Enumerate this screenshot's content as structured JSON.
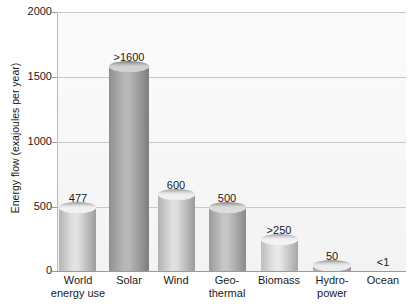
{
  "chart_data": {
    "type": "bar",
    "title": "",
    "xlabel": "",
    "ylabel": "Energy flow (exajoules per year)",
    "ylim": [
      0,
      2000
    ],
    "yticks": [
      0,
      500,
      1000,
      1500,
      2000
    ],
    "ytick_labels": [
      "0",
      "500",
      "1000",
      "1500",
      "2000"
    ],
    "grid": true,
    "legend": "none",
    "categories": [
      "World energy use",
      "Solar",
      "Wind",
      "Geo-thermal",
      "Biomass",
      "Hydro-power",
      "Ocean"
    ],
    "category_lines": [
      [
        "World",
        "energy use"
      ],
      [
        "Solar",
        ""
      ],
      [
        "Wind",
        ""
      ],
      [
        "Geo-",
        "thermal"
      ],
      [
        "Biomass",
        ""
      ],
      [
        "Hydro-",
        "power"
      ],
      [
        "Ocean",
        ""
      ]
    ],
    "values": [
      477,
      1600,
      600,
      500,
      250,
      50,
      1
    ],
    "value_labels": [
      "477",
      ">1600",
      "600",
      "500",
      ">250",
      "50",
      "<1"
    ]
  },
  "bars": [
    {
      "label": "477",
      "left": 59,
      "width": 37,
      "top": 207,
      "height": 64,
      "shade_left": "#b5b5b5",
      "shade_mid": "#e2e2e2",
      "shade_right": "#9d9d9d",
      "cap_top": "#f1f1f1",
      "cap_edge": "#8f8f8f",
      "label_left": 50,
      "label_top": 192,
      "label_width": 56,
      "cat_left": 44,
      "cat_top": 274,
      "cat_width": 68
    },
    {
      "label": ">1600",
      "left": 109,
      "width": 40,
      "top": 66,
      "height": 205,
      "shade_left": "#8f8f8f",
      "shade_mid": "#b8b8b8",
      "shade_right": "#7d7d7d",
      "cap_top": "#d2d2d2",
      "cap_edge": "#6f6f6f",
      "label_left": 101,
      "label_top": 51,
      "label_width": 56,
      "cat_left": 101,
      "cat_top": 274,
      "cat_width": 56
    },
    {
      "label": "600",
      "left": 158,
      "width": 37,
      "top": 194,
      "height": 77,
      "shade_left": "#b0b0b0",
      "shade_mid": "#e0e0e0",
      "shade_right": "#9a9a9a",
      "cap_top": "#efefef",
      "cap_edge": "#8c8c8c",
      "label_left": 148,
      "label_top": 179,
      "label_width": 56,
      "cat_left": 148,
      "cat_top": 274,
      "cat_width": 56
    },
    {
      "label": "500",
      "left": 209,
      "width": 37,
      "top": 207,
      "height": 64,
      "shade_left": "#9a9a9a",
      "shade_mid": "#c6c6c6",
      "shade_right": "#8a8a8a",
      "cap_top": "#dcdcdc",
      "cap_edge": "#7c7c7c",
      "label_left": 199,
      "label_top": 192,
      "label_width": 56,
      "cat_left": 199,
      "cat_top": 274,
      "cat_width": 56
    },
    {
      "label": ">250",
      "left": 261,
      "width": 37,
      "top": 239,
      "height": 32,
      "shade_left": "#bdbdbd",
      "shade_mid": "#e8e8e8",
      "shade_right": "#a6a6a6",
      "cap_top": "#f3f3f3",
      "cap_edge": "#989898",
      "label_left": 251,
      "label_top": 224,
      "label_width": 56,
      "cat_left": 251,
      "cat_top": 274,
      "cat_width": 56
    },
    {
      "label": "50",
      "left": 313,
      "width": 38,
      "top": 265,
      "height": 6,
      "shade_left": "#a8a8a8",
      "shade_mid": "#dedede",
      "shade_right": "#949494",
      "cap_top": "#ededed",
      "cap_edge": "#888888",
      "label_left": 304,
      "label_top": 250,
      "label_width": 56,
      "cat_left": 304,
      "cat_top": 274,
      "cat_width": 56
    },
    {
      "label": "<1",
      "left": 365,
      "width": 36,
      "top": 271,
      "height": 0,
      "shade_left": "#b0b0b0",
      "shade_mid": "#e0e0e0",
      "shade_right": "#9a9a9a",
      "cap_top": "#efefef",
      "cap_edge": "#8c8c8c",
      "label_left": 355,
      "label_top": 256,
      "label_width": 56,
      "cat_left": 355,
      "cat_top": 274,
      "cat_width": 56
    }
  ],
  "gridlines": [
    {
      "value": 2000,
      "label": "2000",
      "y": 12,
      "label_top": 6
    },
    {
      "value": 1500,
      "label": "1500",
      "y": 77,
      "label_top": 71
    },
    {
      "value": 1000,
      "label": "1000",
      "y": 142,
      "label_top": 136
    },
    {
      "value": 500,
      "label": "500",
      "y": 207,
      "label_top": 201
    },
    {
      "value": 0,
      "label": "0",
      "y": 271,
      "label_top": 265
    }
  ],
  "colors": {
    "plot_background": "#f8f8f8",
    "gridline": "#c9c9c9",
    "axis": "#9a9a9a",
    "text": "#1a1a1a"
  }
}
